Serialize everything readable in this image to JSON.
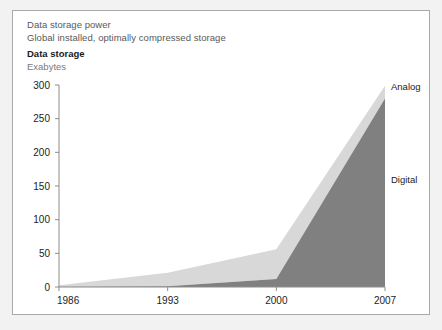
{
  "figure": {
    "background_color": "#f2f2f2",
    "card_background": "#ffffff",
    "border_color": "#a9a9a9"
  },
  "header": {
    "kicker": "Data storage power",
    "subtitle": "Global installed, optimally compressed storage",
    "title": "Data storage",
    "unit": "Exabytes"
  },
  "chart_data": {
    "type": "area",
    "stacked": true,
    "title": "Data storage",
    "subtitle": "Global installed, optimally compressed storage",
    "kicker": "Data storage power",
    "xlabel": "",
    "ylabel": "Exabytes",
    "ylim": [
      0,
      300
    ],
    "xlim": [
      1986,
      2007
    ],
    "yticks": [
      0,
      50,
      100,
      150,
      200,
      250,
      300
    ],
    "ytick_labels": [
      "0",
      "50",
      "100",
      "150",
      "200",
      "250",
      "300"
    ],
    "xticks": [
      1986,
      1993,
      2000,
      2007
    ],
    "xtick_labels": [
      "1986",
      "1993",
      "2000",
      "2007"
    ],
    "x": [
      1986,
      1993,
      2000,
      2007
    ],
    "grid": false,
    "legend_position": "right-inline",
    "series": [
      {
        "name": "Digital",
        "color": "#808080",
        "label_color": "#222222",
        "values": [
          0.02,
          1.0,
          12.0,
          280.0
        ]
      },
      {
        "name": "Analog",
        "color": "#d8d8d8",
        "label_color": "#222222",
        "values": [
          2.6,
          20.0,
          44.0,
          19.0
        ]
      }
    ],
    "totals": [
      2.6,
      21.0,
      56.0,
      299.0
    ],
    "annotations": [
      {
        "text": "Analog",
        "x": 2007,
        "y": 292,
        "anchor": "left"
      },
      {
        "text": "Digital",
        "x": 2007,
        "y": 155,
        "anchor": "left"
      }
    ]
  }
}
